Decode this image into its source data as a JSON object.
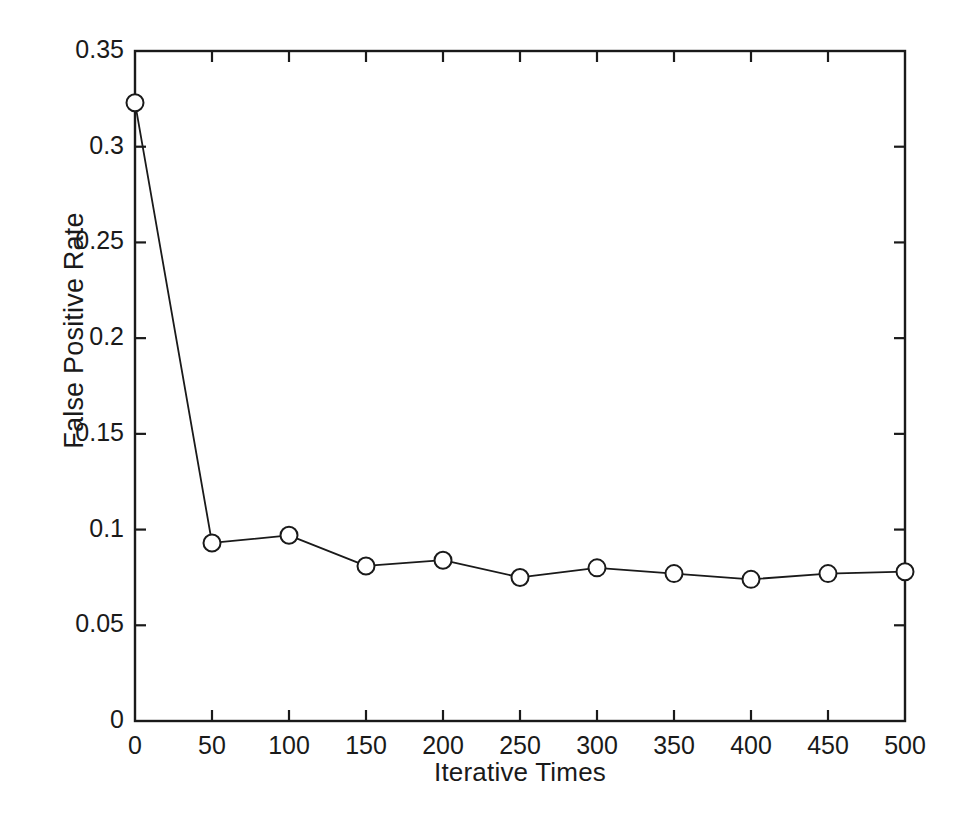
{
  "chart_data": {
    "type": "line",
    "title": "",
    "xlabel": "Iterative Times",
    "ylabel": "False Positive Rate",
    "xlim": [
      0,
      500
    ],
    "ylim": [
      0,
      0.35
    ],
    "grid": false,
    "legend": null,
    "marker": "circle-open",
    "line_color": "#1a1a1a",
    "marker_color": "#1a1a1a",
    "background_color": "#ffffff",
    "x": [
      0,
      50,
      100,
      150,
      200,
      250,
      300,
      350,
      400,
      450,
      500
    ],
    "values": [
      0.323,
      0.093,
      0.097,
      0.081,
      0.084,
      0.075,
      0.08,
      0.077,
      0.074,
      0.077,
      0.078
    ],
    "series": [
      {
        "name": "False Positive Rate",
        "x": [
          0,
          50,
          100,
          150,
          200,
          250,
          300,
          350,
          400,
          450,
          500
        ],
        "values": [
          0.323,
          0.093,
          0.097,
          0.081,
          0.084,
          0.075,
          0.08,
          0.077,
          0.074,
          0.077,
          0.078
        ]
      }
    ],
    "xticks": [
      0,
      50,
      100,
      150,
      200,
      250,
      300,
      350,
      400,
      450,
      500
    ],
    "xtick_labels": [
      "0",
      "50",
      "100",
      "150",
      "200",
      "250",
      "300",
      "350",
      "400",
      "450",
      "500"
    ],
    "yticks": [
      0,
      0.05,
      0.1,
      0.15,
      0.2,
      0.25,
      0.3,
      0.35
    ],
    "ytick_labels": [
      "0",
      "0.05",
      "0.1",
      "0.15",
      "0.2",
      "0.25",
      "0.3",
      "0.35"
    ]
  },
  "caption": ""
}
